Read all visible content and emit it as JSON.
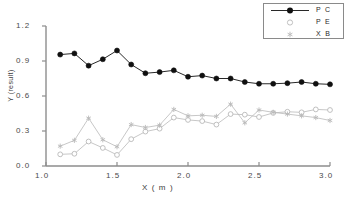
{
  "chart_data": {
    "type": "line",
    "title": "",
    "xlabel": "X  ( m )",
    "ylabel": "Y (result)",
    "xlim": [
      1.0,
      3.0
    ],
    "ylim": [
      0.0,
      1.2
    ],
    "xticks": [
      "1.0",
      "1.5",
      "2.0",
      "2.5",
      "3.0"
    ],
    "xtick_values": [
      1.0,
      1.5,
      2.0,
      2.5,
      3.0
    ],
    "yticks": [
      "0.0",
      "0.3",
      "0.6",
      "0.9",
      "1.2"
    ],
    "ytick_values": [
      0.0,
      0.3,
      0.6,
      0.9,
      1.2
    ],
    "grid": false,
    "legend_position": "top-right",
    "x": [
      1.1,
      1.2,
      1.3,
      1.4,
      1.5,
      1.6,
      1.7,
      1.8,
      1.9,
      2.0,
      2.1,
      2.2,
      2.3,
      2.4,
      2.5,
      2.6,
      2.7,
      2.8,
      2.9,
      3.0
    ],
    "series": [
      {
        "name": "P C",
        "marker": "filled-circle",
        "color": "#101010",
        "values": [
          0.955,
          0.965,
          0.86,
          0.915,
          0.99,
          0.87,
          0.795,
          0.805,
          0.82,
          0.765,
          0.775,
          0.75,
          0.75,
          0.72,
          0.705,
          0.705,
          0.71,
          0.72,
          0.705,
          0.7
        ]
      },
      {
        "name": "P E",
        "marker": "open-circle",
        "color": "#b9b9b9",
        "values": [
          0.1,
          0.105,
          0.21,
          0.155,
          0.095,
          0.23,
          0.295,
          0.32,
          0.415,
          0.395,
          0.385,
          0.355,
          0.445,
          0.44,
          0.42,
          0.455,
          0.465,
          0.46,
          0.485,
          0.48
        ]
      },
      {
        "name": "X B",
        "marker": "asterisk",
        "color": "#b9b9b9",
        "values": [
          0.17,
          0.22,
          0.41,
          0.225,
          0.165,
          0.355,
          0.33,
          0.35,
          0.485,
          0.43,
          0.435,
          0.425,
          0.53,
          0.37,
          0.48,
          0.46,
          0.445,
          0.43,
          0.415,
          0.39
        ]
      }
    ]
  },
  "legend": {
    "items": [
      {
        "label": "P C"
      },
      {
        "label": "P E"
      },
      {
        "label": "X B"
      }
    ]
  }
}
